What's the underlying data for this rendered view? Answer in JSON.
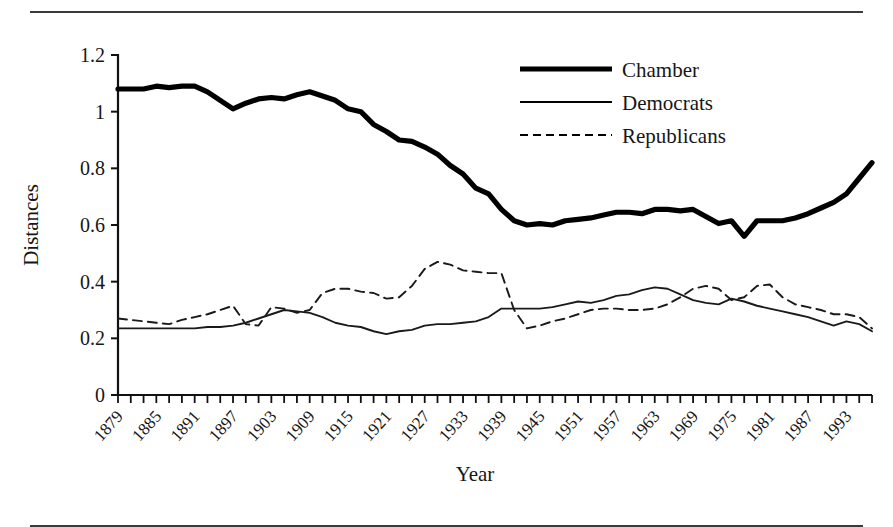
{
  "figure": {
    "top_partial_text": "",
    "x_axis_title": "Year",
    "y_axis_title": "Distances"
  },
  "legend": {
    "position": "top-right",
    "items": [
      {
        "label": "Chamber",
        "style": "thick-solid"
      },
      {
        "label": "Democrats",
        "style": "thin-solid"
      },
      {
        "label": "Republicans",
        "style": "dashed"
      }
    ]
  },
  "chart_data": {
    "type": "line",
    "title": "",
    "subtitle": "",
    "xlabel": "Year",
    "ylabel": "Distances",
    "xlim": [
      1879,
      1997
    ],
    "ylim": [
      0,
      1.2
    ],
    "grid": false,
    "legend_position": "top-right",
    "ytick_labels": [
      "0",
      "0.2",
      "0.4",
      "0.6",
      "0.8",
      "1",
      "1.2"
    ],
    "ytick_values": [
      0,
      0.2,
      0.4,
      0.6,
      0.8,
      1.0,
      1.2
    ],
    "xtick_labels": [
      "1879",
      "1885",
      "1891",
      "1897",
      "1903",
      "1909",
      "1915",
      "1921",
      "1927",
      "1933",
      "1939",
      "1945",
      "1951",
      "1957",
      "1963",
      "1969",
      "1975",
      "1981",
      "1987",
      "1993"
    ],
    "xtick_values": [
      1879,
      1885,
      1891,
      1897,
      1903,
      1909,
      1915,
      1921,
      1927,
      1933,
      1939,
      1945,
      1951,
      1957,
      1963,
      1969,
      1975,
      1981,
      1987,
      1993
    ],
    "minor_tick_step_years": 2,
    "x": [
      1879,
      1881,
      1883,
      1885,
      1887,
      1889,
      1891,
      1893,
      1895,
      1897,
      1899,
      1901,
      1903,
      1905,
      1907,
      1909,
      1911,
      1913,
      1915,
      1917,
      1919,
      1921,
      1923,
      1925,
      1927,
      1929,
      1931,
      1933,
      1935,
      1937,
      1939,
      1941,
      1943,
      1945,
      1947,
      1949,
      1951,
      1953,
      1955,
      1957,
      1959,
      1961,
      1963,
      1965,
      1967,
      1969,
      1971,
      1973,
      1975,
      1977,
      1979,
      1981,
      1983,
      1985,
      1987,
      1989,
      1991,
      1993,
      1995,
      1997
    ],
    "series": [
      {
        "name": "Chamber",
        "style": "thick-solid",
        "color": "#000000",
        "values": [
          1.08,
          1.08,
          1.08,
          1.09,
          1.085,
          1.09,
          1.09,
          1.07,
          1.04,
          1.01,
          1.03,
          1.045,
          1.05,
          1.045,
          1.06,
          1.07,
          1.055,
          1.04,
          1.01,
          1.0,
          0.955,
          0.93,
          0.9,
          0.895,
          0.875,
          0.85,
          0.81,
          0.78,
          0.73,
          0.71,
          0.655,
          0.615,
          0.6,
          0.605,
          0.6,
          0.615,
          0.62,
          0.625,
          0.635,
          0.645,
          0.645,
          0.64,
          0.655,
          0.655,
          0.65,
          0.655,
          0.63,
          0.605,
          0.615,
          0.56,
          0.615,
          0.615,
          0.615,
          0.625,
          0.64,
          0.66,
          0.68,
          0.71,
          0.765,
          0.82
        ]
      },
      {
        "name": "Democrats",
        "style": "thin-solid",
        "color": "#1a1a1a",
        "values": [
          0.235,
          0.235,
          0.235,
          0.235,
          0.235,
          0.235,
          0.235,
          0.24,
          0.24,
          0.245,
          0.255,
          0.27,
          0.285,
          0.3,
          0.295,
          0.29,
          0.275,
          0.255,
          0.245,
          0.24,
          0.225,
          0.215,
          0.225,
          0.23,
          0.245,
          0.25,
          0.25,
          0.255,
          0.26,
          0.275,
          0.305,
          0.305,
          0.305,
          0.305,
          0.31,
          0.32,
          0.33,
          0.325,
          0.335,
          0.35,
          0.355,
          0.37,
          0.38,
          0.375,
          0.355,
          0.335,
          0.325,
          0.32,
          0.34,
          0.33,
          0.315,
          0.305,
          0.295,
          0.285,
          0.275,
          0.26,
          0.245,
          0.26,
          0.25,
          0.225
        ]
      },
      {
        "name": "Republicans",
        "style": "dashed",
        "color": "#1a1a1a",
        "values": [
          0.27,
          0.265,
          0.26,
          0.255,
          0.25,
          0.265,
          0.275,
          0.285,
          0.3,
          0.315,
          0.25,
          0.245,
          0.31,
          0.305,
          0.29,
          0.3,
          0.36,
          0.375,
          0.375,
          0.365,
          0.36,
          0.34,
          0.345,
          0.385,
          0.445,
          0.47,
          0.46,
          0.44,
          0.435,
          0.43,
          0.43,
          0.3,
          0.235,
          0.245,
          0.26,
          0.27,
          0.285,
          0.3,
          0.305,
          0.305,
          0.3,
          0.3,
          0.305,
          0.32,
          0.345,
          0.375,
          0.385,
          0.375,
          0.335,
          0.345,
          0.385,
          0.39,
          0.345,
          0.32,
          0.31,
          0.3,
          0.285,
          0.285,
          0.275,
          0.235
        ]
      }
    ]
  }
}
